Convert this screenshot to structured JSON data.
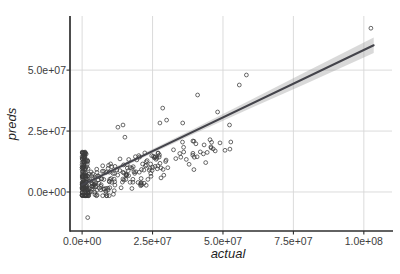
{
  "figure": {
    "width": 400,
    "height": 274,
    "background": "#ffffff"
  },
  "chart_data": {
    "type": "scatter",
    "title": "",
    "xlabel": "actual",
    "ylabel": "preds",
    "legend": "none",
    "grid": "major-only",
    "xlim": [
      -4300000.0,
      110000000.0
    ],
    "ylim": [
      -16000000.0,
      72200000.0
    ],
    "x_ticks": {
      "values": [
        0,
        25000000.0,
        50000000.0,
        75000000.0,
        100000000.0
      ],
      "labels": [
        "0.0e+00",
        "2.5e+07",
        "5.0e+07",
        "7.5e+07",
        "1.0e+08"
      ]
    },
    "y_ticks": {
      "values": [
        0,
        25000000.0,
        50000000.0
      ],
      "labels": [
        "0.0e+00",
        "2.5e+07",
        "5.0e+07"
      ]
    },
    "regression": {
      "type": "linear-smooth-with-confidence-band",
      "x0": 0,
      "y0": 2900000.0,
      "x1": 103500000.0,
      "y1": 60200000.0,
      "band_x": [
        0,
        20000000.0,
        40000000.0,
        60000000.0,
        80000000.0,
        103500000.0
      ],
      "band_halfwidth": [
        900000.0,
        750000.0,
        1100000.0,
        1700000.0,
        2450000.0,
        3200000.0
      ]
    },
    "notable_points": [
      [
        102500000.0,
        67200000.0
      ],
      [
        58300000.0,
        48000000.0
      ],
      [
        55800000.0,
        43900000.0
      ],
      [
        41000000.0,
        39800000.0
      ],
      [
        48100000.0,
        32800000.0
      ],
      [
        52300000.0,
        27500000.0
      ],
      [
        28600000.0,
        34400000.0
      ],
      [
        30000000.0,
        29500000.0
      ],
      [
        35700000.0,
        28300000.0
      ],
      [
        27600000.0,
        28300000.0
      ],
      [
        12700000.0,
        26600000.0
      ],
      [
        14500000.0,
        27500000.0
      ],
      [
        15200000.0,
        22500000.0
      ],
      [
        2000000.0,
        -10500000.0
      ]
    ],
    "point_clusters": [
      {
        "name": "near-zero-vertical-strip",
        "n": 120,
        "actual_range": [
          0,
          2200000.0
        ],
        "actual_pow": 2.2,
        "preds_model": "power",
        "preds_range": [
          -1500000.0,
          16500000.0
        ],
        "preds_pow": 1.35
      },
      {
        "name": "main-cloud",
        "n": 175,
        "actual_range": [
          1000000.0,
          28000000.0
        ],
        "actual_pow": 1.7,
        "preds_model": "linear",
        "slope": 0.45,
        "noise": 8000000.0,
        "preds_clip": [
          -1500000.0,
          29000000.0
        ]
      },
      {
        "name": "mid-spread",
        "n": 42,
        "actual_range": [
          27000000.0,
          53000000.0
        ],
        "actual_pow": 1.25,
        "preds_model": "linear",
        "slope": 0.38,
        "noise": 8000000.0,
        "preds_clip": [
          4000000.0,
          32000000.0
        ]
      }
    ],
    "random_seed": 7,
    "point_style": {
      "shape": "open-circle",
      "radius": 1.9,
      "stroke": "#3b3b3b",
      "stroke_width": 0.85,
      "opacity": 0.9
    },
    "colors": {
      "background": "#ffffff",
      "grid": "#d7d7d7",
      "axis_line": "#2e2e2e",
      "tick_label": "#3d3d3d",
      "axis_title": "#1f1f1f",
      "regression_line": "#44444b",
      "confidence_band": "#9c9c9c",
      "band_opacity": 0.38
    },
    "layout": {
      "panel": {
        "left": 70,
        "right": 392,
        "top": 16,
        "bottom": 231
      },
      "x_tick_label_y": 245,
      "x_title_pos": [
        228,
        258
      ],
      "y_title_pos": [
        16,
        124
      ],
      "tick_length": 3.5
    }
  }
}
